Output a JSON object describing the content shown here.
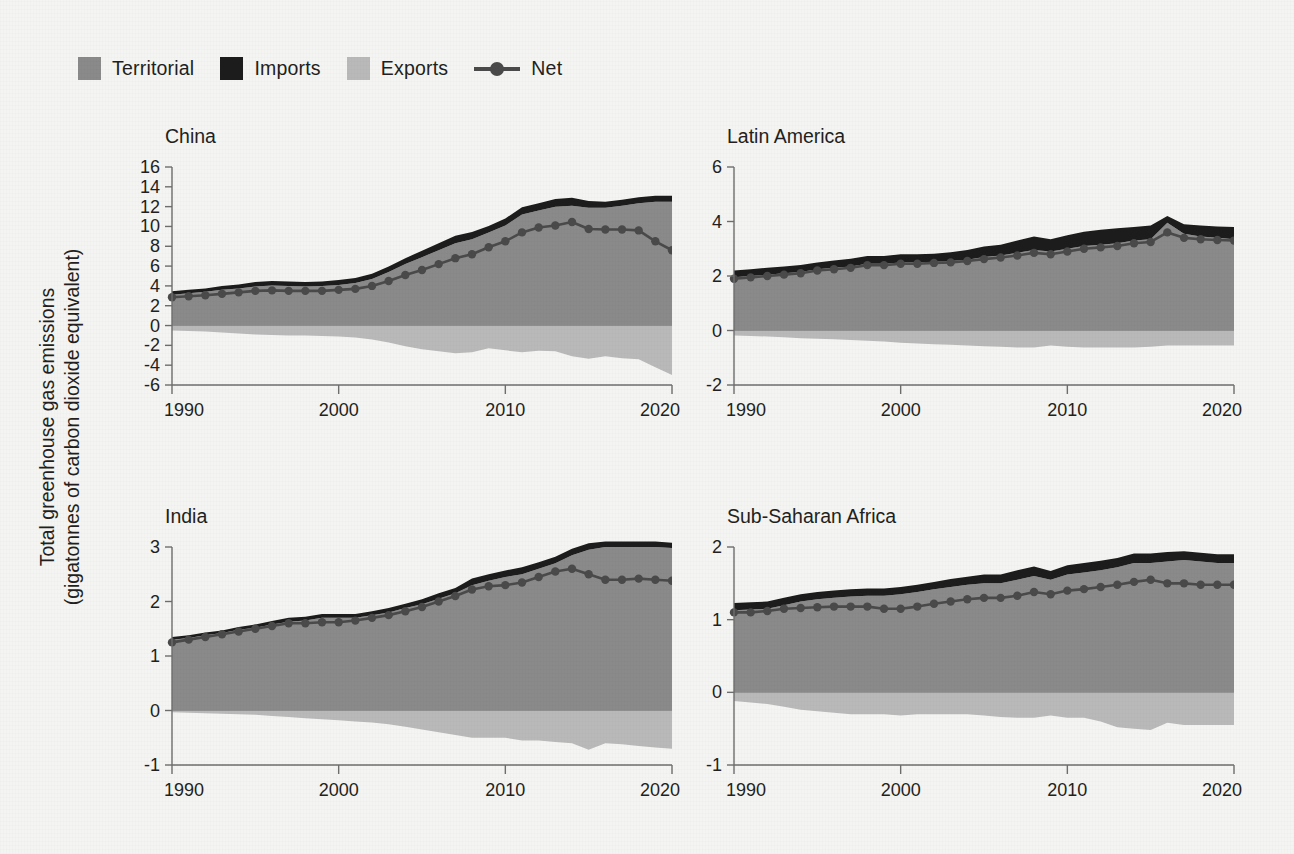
{
  "figure": {
    "ylabel_line1": "Total greenhouse gas emissions",
    "ylabel_line2": "(gigatonnes of carbon dioxide equivalent)",
    "background_color": "#f4f4f2"
  },
  "legend": {
    "items": [
      {
        "label": "Territorial",
        "type": "swatch",
        "color": "#8a8a8a",
        "icon": "square-swatch-icon"
      },
      {
        "label": "Imports",
        "type": "swatch",
        "color": "#1c1c1c",
        "icon": "square-swatch-icon"
      },
      {
        "label": "Exports",
        "type": "swatch",
        "color": "#b9b9b9",
        "icon": "square-swatch-icon"
      },
      {
        "label": "Net",
        "type": "line-marker",
        "color": "#4a4a4a",
        "icon": "line-with-dot-icon"
      }
    ]
  },
  "colors": {
    "territorial": "#8a8a8a",
    "imports": "#1c1c1c",
    "exports": "#b9b9b9",
    "net": "#4a4a4a",
    "axis": "#6e6e6e",
    "text": "#231f20"
  },
  "chart_data": [
    {
      "type": "area",
      "title": "China",
      "xlabel": "",
      "ylabel": "Total greenhouse gas emissions (gigatonnes of carbon dioxide equivalent)",
      "xlim": [
        1990,
        2020
      ],
      "ylim": [
        -6,
        16
      ],
      "yticks": [
        -6,
        -4,
        -2,
        0,
        2,
        4,
        6,
        8,
        10,
        12,
        14,
        16
      ],
      "xticks": [
        1990,
        2000,
        2010,
        2020
      ],
      "grid": false,
      "legend_position": "top-left-figure",
      "x": [
        1990,
        1991,
        1992,
        1993,
        1994,
        1995,
        1996,
        1997,
        1998,
        1999,
        2000,
        2001,
        2002,
        2003,
        2004,
        2005,
        2006,
        2007,
        2008,
        2009,
        2010,
        2011,
        2012,
        2013,
        2014,
        2015,
        2016,
        2017,
        2018,
        2019,
        2020
      ],
      "series": [
        {
          "name": "Territorial",
          "values": [
            3.1,
            3.25,
            3.4,
            3.6,
            3.75,
            3.95,
            4.05,
            4.0,
            3.95,
            4.0,
            4.1,
            4.3,
            4.7,
            5.4,
            6.2,
            6.9,
            7.6,
            8.3,
            8.7,
            9.4,
            10.1,
            11.2,
            11.6,
            12.0,
            12.1,
            11.9,
            11.9,
            12.1,
            12.35,
            12.5,
            12.5
          ]
        },
        {
          "name": "Imports",
          "values": [
            0.35,
            0.35,
            0.35,
            0.38,
            0.4,
            0.45,
            0.45,
            0.45,
            0.45,
            0.45,
            0.5,
            0.5,
            0.52,
            0.55,
            0.6,
            0.65,
            0.7,
            0.75,
            0.75,
            0.65,
            0.7,
            0.75,
            0.75,
            0.78,
            0.8,
            0.68,
            0.6,
            0.6,
            0.6,
            0.6,
            0.6
          ]
        },
        {
          "name": "Exports",
          "values": [
            -0.5,
            -0.55,
            -0.6,
            -0.7,
            -0.8,
            -0.9,
            -0.95,
            -1.0,
            -1.0,
            -1.05,
            -1.1,
            -1.2,
            -1.4,
            -1.7,
            -2.1,
            -2.4,
            -2.6,
            -2.8,
            -2.7,
            -2.3,
            -2.5,
            -2.7,
            -2.55,
            -2.6,
            -3.1,
            -3.35,
            -3.1,
            -3.3,
            -3.4,
            -4.2,
            -5.0
          ]
        },
        {
          "name": "Net",
          "values": [
            2.85,
            2.95,
            3.05,
            3.2,
            3.35,
            3.5,
            3.55,
            3.5,
            3.5,
            3.5,
            3.6,
            3.7,
            4.0,
            4.5,
            5.1,
            5.6,
            6.2,
            6.8,
            7.2,
            7.9,
            8.5,
            9.4,
            9.9,
            10.1,
            10.45,
            9.75,
            9.7,
            9.7,
            9.6,
            8.5,
            7.6
          ]
        }
      ]
    },
    {
      "type": "area",
      "title": "Latin America",
      "xlabel": "",
      "ylabel": "",
      "xlim": [
        1990,
        2020
      ],
      "ylim": [
        -2,
        6
      ],
      "yticks": [
        -2,
        0,
        2,
        4,
        6
      ],
      "xticks": [
        1990,
        2000,
        2010,
        2020
      ],
      "grid": false,
      "x": [
        1990,
        1991,
        1992,
        1993,
        1994,
        1995,
        1996,
        1997,
        1998,
        1999,
        2000,
        2001,
        2002,
        2003,
        2004,
        2005,
        2006,
        2007,
        2008,
        2009,
        2010,
        2011,
        2012,
        2013,
        2014,
        2015,
        2016,
        2017,
        2018,
        2019,
        2020
      ],
      "series": [
        {
          "name": "Territorial",
          "values": [
            1.95,
            2.0,
            2.05,
            2.1,
            2.15,
            2.25,
            2.3,
            2.35,
            2.45,
            2.45,
            2.5,
            2.5,
            2.52,
            2.55,
            2.6,
            2.7,
            2.75,
            2.85,
            2.95,
            2.9,
            3.0,
            3.1,
            3.15,
            3.2,
            3.3,
            3.35,
            3.95,
            3.55,
            3.45,
            3.4,
            3.35
          ]
        },
        {
          "name": "Imports",
          "values": [
            0.25,
            0.25,
            0.25,
            0.25,
            0.25,
            0.25,
            0.27,
            0.28,
            0.28,
            0.28,
            0.3,
            0.3,
            0.3,
            0.32,
            0.35,
            0.38,
            0.4,
            0.45,
            0.5,
            0.45,
            0.5,
            0.52,
            0.55,
            0.55,
            0.5,
            0.5,
            0.25,
            0.35,
            0.4,
            0.42,
            0.45
          ]
        },
        {
          "name": "Exports",
          "values": [
            -0.18,
            -0.2,
            -0.22,
            -0.25,
            -0.28,
            -0.3,
            -0.32,
            -0.35,
            -0.38,
            -0.4,
            -0.45,
            -0.48,
            -0.5,
            -0.52,
            -0.55,
            -0.58,
            -0.6,
            -0.62,
            -0.62,
            -0.55,
            -0.6,
            -0.62,
            -0.62,
            -0.62,
            -0.62,
            -0.6,
            -0.55,
            -0.55,
            -0.55,
            -0.55,
            -0.55
          ]
        },
        {
          "name": "Net",
          "values": [
            1.9,
            1.95,
            2.0,
            2.05,
            2.1,
            2.2,
            2.25,
            2.3,
            2.4,
            2.4,
            2.45,
            2.45,
            2.48,
            2.5,
            2.55,
            2.62,
            2.68,
            2.75,
            2.85,
            2.8,
            2.9,
            3.0,
            3.05,
            3.1,
            3.2,
            3.25,
            3.6,
            3.4,
            3.35,
            3.32,
            3.3
          ]
        }
      ]
    },
    {
      "type": "area",
      "title": "India",
      "xlabel": "",
      "ylabel": "",
      "xlim": [
        1990,
        2020
      ],
      "ylim": [
        -1,
        3
      ],
      "yticks": [
        -1,
        0,
        1,
        2,
        3
      ],
      "xticks": [
        1990,
        2000,
        2010,
        2020
      ],
      "grid": false,
      "x": [
        1990,
        1991,
        1992,
        1993,
        1994,
        1995,
        1996,
        1997,
        1998,
        1999,
        2000,
        2001,
        2002,
        2003,
        2004,
        2005,
        2006,
        2007,
        2008,
        2009,
        2010,
        2011,
        2012,
        2013,
        2014,
        2015,
        2016,
        2017,
        2018,
        2019,
        2020
      ],
      "series": [
        {
          "name": "Territorial",
          "values": [
            1.3,
            1.33,
            1.38,
            1.42,
            1.48,
            1.52,
            1.58,
            1.63,
            1.65,
            1.7,
            1.7,
            1.7,
            1.75,
            1.8,
            1.88,
            1.95,
            2.05,
            2.15,
            2.3,
            2.38,
            2.45,
            2.5,
            2.6,
            2.7,
            2.85,
            2.95,
            3.0,
            3.0,
            3.0,
            3.0,
            2.98
          ]
        },
        {
          "name": "Imports",
          "values": [
            0.05,
            0.05,
            0.05,
            0.05,
            0.05,
            0.06,
            0.06,
            0.07,
            0.07,
            0.07,
            0.07,
            0.07,
            0.07,
            0.08,
            0.08,
            0.09,
            0.1,
            0.1,
            0.12,
            0.12,
            0.12,
            0.13,
            0.12,
            0.12,
            0.12,
            0.12,
            0.1,
            0.1,
            0.1,
            0.1,
            0.1
          ]
        },
        {
          "name": "Exports",
          "values": [
            -0.03,
            -0.04,
            -0.05,
            -0.06,
            -0.07,
            -0.08,
            -0.1,
            -0.12,
            -0.14,
            -0.16,
            -0.18,
            -0.2,
            -0.22,
            -0.25,
            -0.3,
            -0.35,
            -0.4,
            -0.45,
            -0.5,
            -0.5,
            -0.5,
            -0.55,
            -0.55,
            -0.58,
            -0.6,
            -0.72,
            -0.6,
            -0.62,
            -0.65,
            -0.68,
            -0.7
          ]
        },
        {
          "name": "Net",
          "values": [
            1.25,
            1.3,
            1.35,
            1.4,
            1.45,
            1.5,
            1.55,
            1.6,
            1.6,
            1.62,
            1.62,
            1.65,
            1.7,
            1.75,
            1.82,
            1.9,
            2.0,
            2.1,
            2.22,
            2.28,
            2.3,
            2.35,
            2.45,
            2.55,
            2.6,
            2.5,
            2.4,
            2.4,
            2.42,
            2.4,
            2.38
          ]
        }
      ]
    },
    {
      "type": "area",
      "title": "Sub-Saharan Africa",
      "xlabel": "",
      "ylabel": "",
      "xlim": [
        1990,
        2020
      ],
      "ylim": [
        -1,
        2
      ],
      "yticks": [
        -1,
        0,
        1,
        2
      ],
      "xticks": [
        1990,
        2000,
        2010,
        2020
      ],
      "grid": false,
      "x": [
        1990,
        1991,
        1992,
        1993,
        1994,
        1995,
        1996,
        1997,
        1998,
        1999,
        2000,
        2001,
        2002,
        2003,
        2004,
        2005,
        2006,
        2007,
        2008,
        2009,
        2010,
        2011,
        2012,
        2013,
        2014,
        2015,
        2016,
        2017,
        2018,
        2019,
        2020
      ],
      "series": [
        {
          "name": "Territorial",
          "values": [
            1.13,
            1.14,
            1.15,
            1.2,
            1.25,
            1.28,
            1.3,
            1.32,
            1.33,
            1.33,
            1.35,
            1.38,
            1.42,
            1.45,
            1.48,
            1.5,
            1.5,
            1.55,
            1.6,
            1.55,
            1.62,
            1.65,
            1.68,
            1.72,
            1.78,
            1.78,
            1.8,
            1.82,
            1.8,
            1.78,
            1.78
          ]
        },
        {
          "name": "Imports",
          "values": [
            0.1,
            0.1,
            0.1,
            0.1,
            0.1,
            0.1,
            0.1,
            0.1,
            0.1,
            0.1,
            0.1,
            0.1,
            0.1,
            0.11,
            0.11,
            0.12,
            0.12,
            0.13,
            0.13,
            0.12,
            0.13,
            0.13,
            0.13,
            0.13,
            0.13,
            0.13,
            0.13,
            0.12,
            0.12,
            0.12,
            0.12
          ]
        },
        {
          "name": "Exports",
          "values": [
            -0.12,
            -0.14,
            -0.16,
            -0.2,
            -0.24,
            -0.26,
            -0.28,
            -0.3,
            -0.3,
            -0.3,
            -0.32,
            -0.3,
            -0.3,
            -0.3,
            -0.3,
            -0.32,
            -0.34,
            -0.35,
            -0.35,
            -0.32,
            -0.35,
            -0.35,
            -0.4,
            -0.48,
            -0.5,
            -0.52,
            -0.42,
            -0.45,
            -0.45,
            -0.45,
            -0.45
          ]
        },
        {
          "name": "Net",
          "values": [
            1.1,
            1.1,
            1.12,
            1.15,
            1.16,
            1.17,
            1.18,
            1.18,
            1.18,
            1.15,
            1.15,
            1.18,
            1.22,
            1.25,
            1.28,
            1.3,
            1.3,
            1.33,
            1.38,
            1.35,
            1.4,
            1.42,
            1.45,
            1.48,
            1.52,
            1.55,
            1.5,
            1.5,
            1.48,
            1.48,
            1.48
          ]
        }
      ]
    }
  ]
}
